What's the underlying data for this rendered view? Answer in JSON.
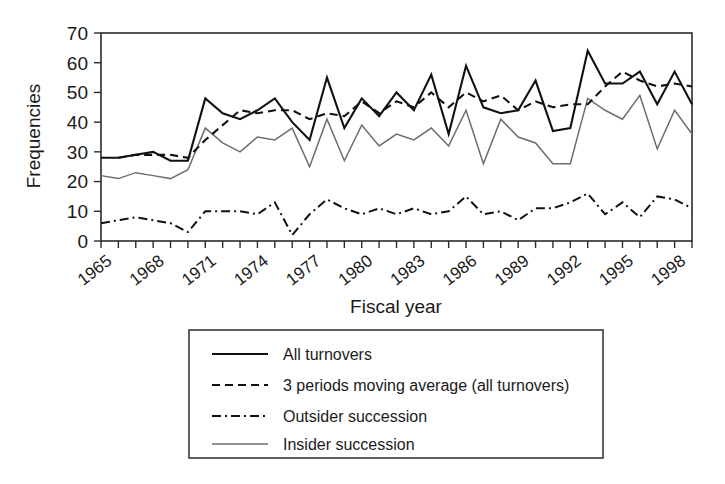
{
  "chart_data": {
    "type": "line",
    "title": "",
    "xlabel": "Fiscal year",
    "ylabel": "Frequencies",
    "ylim": [
      0,
      70
    ],
    "yticks": [
      0,
      10,
      20,
      30,
      40,
      50,
      60,
      70
    ],
    "xlim": [
      1965,
      1999
    ],
    "xticklabels": [
      "1965",
      "1968",
      "1971",
      "1974",
      "1977",
      "1980",
      "1983",
      "1986",
      "1989",
      "1992",
      "1995",
      "1998"
    ],
    "xtick_step_labeled": 3,
    "xtick_step_minor": 1,
    "grid": false,
    "legend_position": "below-plot",
    "x": [
      1965,
      1966,
      1967,
      1968,
      1969,
      1970,
      1971,
      1972,
      1973,
      1974,
      1975,
      1976,
      1977,
      1978,
      1979,
      1980,
      1981,
      1982,
      1983,
      1984,
      1985,
      1986,
      1987,
      1988,
      1989,
      1990,
      1991,
      1992,
      1993,
      1994,
      1995,
      1996,
      1997,
      1998,
      1999
    ],
    "series": [
      {
        "name": "All turnovers",
        "style": "solid",
        "color": "#111111",
        "values": [
          28,
          28,
          29,
          30,
          27,
          27,
          48,
          43,
          41,
          44,
          48,
          40,
          34,
          55,
          38,
          48,
          42,
          50,
          44,
          56,
          36,
          59,
          45,
          43,
          44,
          54,
          37,
          38,
          64,
          53,
          53,
          57,
          46,
          57,
          46
        ]
      },
      {
        "name": "3 periods moving average (all turnovers)",
        "style": "dashed",
        "color": "#111111",
        "values": [
          null,
          28,
          29,
          29,
          29,
          28,
          34,
          39,
          44,
          43,
          44,
          44,
          41,
          43,
          42,
          47,
          43,
          47,
          45,
          50,
          45,
          50,
          47,
          49,
          44,
          47,
          45,
          46,
          46,
          52,
          57,
          54,
          52,
          53,
          52
        ]
      },
      {
        "name": "Outsider succession",
        "style": "dashdot",
        "color": "#111111",
        "values": [
          6,
          7,
          8,
          7,
          6,
          3,
          10,
          10,
          10,
          9,
          13,
          2,
          9,
          14,
          11,
          9,
          11,
          9,
          11,
          9,
          10,
          15,
          9,
          10,
          7,
          11,
          11,
          13,
          16,
          9,
          13,
          8,
          15,
          14,
          11
        ]
      },
      {
        "name": "Insider succession",
        "style": "solid-thin",
        "color": "#6e6e6e",
        "values": [
          22,
          21,
          23,
          22,
          21,
          24,
          38,
          33,
          30,
          35,
          34,
          38,
          25,
          41,
          27,
          39,
          32,
          36,
          34,
          38,
          32,
          44,
          26,
          41,
          35,
          33,
          26,
          26,
          48,
          44,
          41,
          49,
          31,
          44,
          36
        ]
      }
    ]
  },
  "axes": {
    "y_title": "Frequencies",
    "x_title": "Fiscal year",
    "y_tick_labels": [
      "70",
      "60",
      "50",
      "40",
      "30",
      "20",
      "10",
      "0"
    ],
    "x_tick_labels": [
      "1965",
      "1968",
      "1971",
      "1974",
      "1977",
      "1980",
      "1983",
      "1986",
      "1989",
      "1992",
      "1995",
      "1998"
    ]
  },
  "legend": {
    "items": [
      {
        "label": "All turnovers",
        "style": "solid",
        "color": "#111111"
      },
      {
        "label": "3 periods moving average (all turnovers)",
        "style": "dashed",
        "color": "#111111"
      },
      {
        "label": "Outsider succession",
        "style": "dashdot",
        "color": "#111111"
      },
      {
        "label": "Insider succession",
        "style": "solid-thin",
        "color": "#6e6e6e"
      }
    ]
  }
}
